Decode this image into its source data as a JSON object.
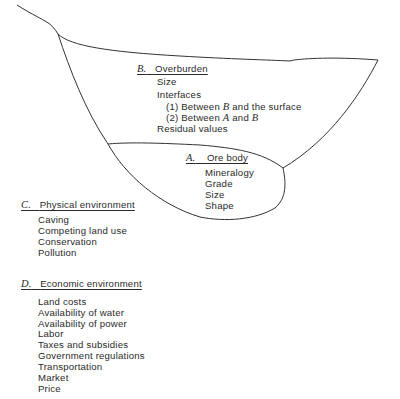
{
  "overburden": {
    "letter": "B.",
    "title": "Overburden",
    "items": [
      "Size",
      "Interfaces"
    ],
    "interfaces": [
      {
        "num": "(1)",
        "pre": "Between",
        "var": "B",
        "post": "and the surface"
      },
      {
        "num": "(2)",
        "pre": "Between",
        "var": "A",
        "and": "and",
        "var2": "B"
      }
    ],
    "last": "Residual values"
  },
  "ore_body": {
    "letter": "A.",
    "title": "Ore body",
    "items": [
      "Mineralogy",
      "Grade",
      "Size",
      "Shape"
    ]
  },
  "physical": {
    "letter": "C.",
    "title": "Physical environment",
    "items": [
      "Caving",
      "Competing land use",
      "Conservation",
      "Pollution"
    ]
  },
  "economic": {
    "letter": "D.",
    "title": "Economic environment",
    "items": [
      "Land costs",
      "Availability of water",
      "Availability of power",
      "Labor",
      "Taxes and subsidies",
      "Government regulations",
      "Transportation",
      "Market",
      "Price"
    ]
  },
  "colors": {
    "line": "#333333",
    "text": "#2a2a2a"
  }
}
